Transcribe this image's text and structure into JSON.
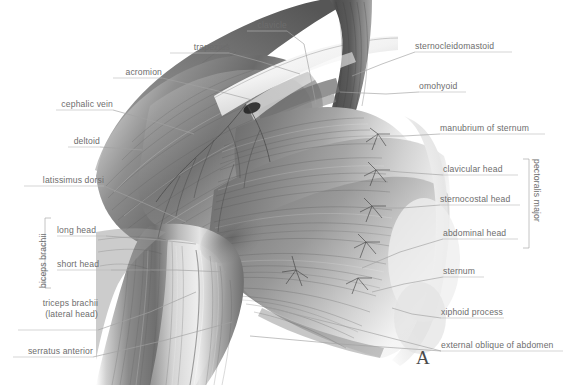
{
  "figure": {
    "panel_letter": "A",
    "text_color": "#6d6d6d",
    "leader_color": "#9a9a9a",
    "background": "#ffffff"
  },
  "labels_left": [
    {
      "id": "trapezius",
      "text": "trapezius"
    },
    {
      "id": "acromion",
      "text": "acromion"
    },
    {
      "id": "cephalic-vein",
      "text": "cephalic vein"
    },
    {
      "id": "deltoid",
      "text": "deltoid"
    },
    {
      "id": "latissimus-dorsi",
      "text": "latissimus dorsi"
    },
    {
      "id": "long-head",
      "text": "long head"
    },
    {
      "id": "short-head",
      "text": "short head"
    },
    {
      "id": "serratus-anterior",
      "text": "serratus anterior"
    }
  ],
  "label_triceps": {
    "line1": "triceps brachii",
    "line2": "(lateral head)"
  },
  "labels_top": [
    {
      "id": "clavicle",
      "text": "clavicle"
    }
  ],
  "labels_right": [
    {
      "id": "sternocleidomastoid",
      "text": "sternocleidomastoid"
    },
    {
      "id": "omohyoid",
      "text": "omohyoid"
    },
    {
      "id": "manubrium-of-sternum",
      "text": "manubrium of sternum"
    },
    {
      "id": "clavicular-head",
      "text": "clavicular head"
    },
    {
      "id": "sternocostal-head",
      "text": "sternocostal head"
    },
    {
      "id": "abdominal-head",
      "text": "abdominal head"
    },
    {
      "id": "sternum",
      "text": "sternum"
    },
    {
      "id": "xiphoid-process",
      "text": "xiphoid process"
    },
    {
      "id": "external-oblique",
      "text": "external oblique of abdomen"
    }
  ],
  "brackets": [
    {
      "id": "biceps-brachii",
      "text": "biceps brachii",
      "side": "left"
    },
    {
      "id": "pectoralis-major",
      "text": "pectoralis major",
      "side": "right"
    }
  ]
}
